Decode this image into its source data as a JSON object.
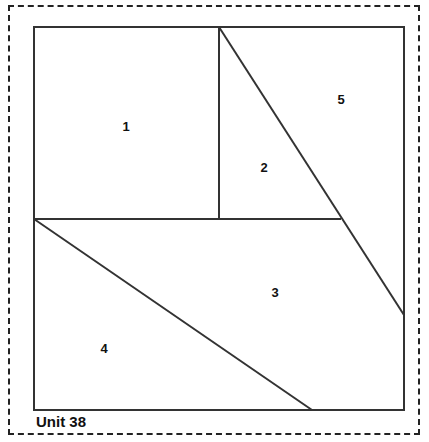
{
  "diagram": {
    "caption": "Unit 38",
    "line_color": "#333333",
    "border_color": "#222222",
    "background_color": "#ffffff",
    "block": {
      "x": 34,
      "y": 27,
      "width": 370,
      "height": 383
    },
    "pieces": [
      {
        "id": "piece-1",
        "label": "1",
        "cx": 126,
        "cy": 126
      },
      {
        "id": "piece-2",
        "label": "2",
        "cx": 264,
        "cy": 167
      },
      {
        "id": "piece-3",
        "label": "3",
        "cx": 275,
        "cy": 292
      },
      {
        "id": "piece-4",
        "label": "4",
        "cx": 104,
        "cy": 348
      },
      {
        "id": "piece-5",
        "label": "5",
        "cx": 341,
        "cy": 99
      }
    ],
    "seam_lines": [
      {
        "name": "vertical-seam-top",
        "x1": 219,
        "y1": 27,
        "x2": 219,
        "y2": 219
      },
      {
        "name": "horizontal-seam-middle",
        "x1": 34,
        "y1": 219,
        "x2": 341,
        "y2": 219
      },
      {
        "name": "diagonal-seam-upper-right",
        "x1": 219,
        "y1": 27,
        "x2": 404,
        "y2": 315
      },
      {
        "name": "diagonal-seam-lower-left",
        "x1": 34,
        "y1": 219,
        "x2": 312,
        "y2": 410
      }
    ]
  }
}
